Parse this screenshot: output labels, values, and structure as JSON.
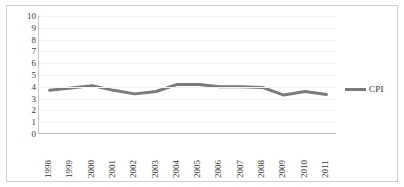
{
  "chart_data": {
    "type": "line",
    "title": "",
    "xlabel": "",
    "ylabel": "",
    "categories": [
      "1998",
      "1999",
      "2000",
      "2001",
      "2002",
      "2003",
      "2004",
      "2005",
      "2006",
      "2007",
      "2008",
      "2009",
      "2010",
      "2011"
    ],
    "series": [
      {
        "name": "CPI",
        "color": "#7a7a7a",
        "values": [
          3.7,
          3.9,
          4.1,
          3.7,
          3.4,
          3.6,
          4.2,
          4.2,
          4.0,
          4.0,
          3.95,
          3.3,
          3.6,
          3.35
        ]
      }
    ],
    "ylim": [
      0,
      10
    ],
    "ytick_labels": [
      "0",
      "1",
      "2",
      "3",
      "4",
      "5",
      "6",
      "7",
      "8",
      "9",
      "10"
    ],
    "ytick_values": [
      0,
      1,
      2,
      3,
      4,
      5,
      6,
      7,
      8,
      9,
      10
    ],
    "grid": true,
    "legend_position": "right"
  },
  "legend": {
    "entries": [
      {
        "label": "CPI",
        "color": "#7a7a7a"
      }
    ]
  },
  "colors": {
    "series": "#7a7a7a",
    "gridline": "#f2f2f2",
    "axis": "#bdbdbd",
    "border": "#cfcfcf",
    "text": "#3a3a3a",
    "background": "#ffffff"
  }
}
